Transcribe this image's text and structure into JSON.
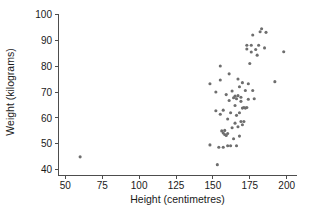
{
  "chart_data": {
    "type": "scatter",
    "title": "",
    "xlabel": "Height (centimetres)",
    "ylabel": "Weight (kilograms)",
    "xlim": [
      45,
      207
    ],
    "ylim": [
      38,
      102
    ],
    "xticks": [
      50,
      75,
      100,
      125,
      150,
      175,
      200
    ],
    "yticks": [
      40,
      50,
      60,
      70,
      80,
      90,
      100
    ],
    "xtick_labels": [
      "50",
      "75",
      "100",
      "125",
      "150",
      "175",
      "200"
    ],
    "ytick_labels": [
      "40",
      "50",
      "60",
      "70",
      "80",
      "90",
      "100"
    ],
    "grid": false,
    "legend": null,
    "marker_color": "#6e6e6e",
    "marker_size": 3.1,
    "points": [
      [
        60,
        45.0
      ],
      [
        148,
        73.2
      ],
      [
        148,
        49.6
      ],
      [
        152,
        62.8
      ],
      [
        152,
        70.0
      ],
      [
        153,
        42.0
      ],
      [
        154,
        48.7
      ],
      [
        155,
        61.4
      ],
      [
        155,
        74.6
      ],
      [
        155,
        80.0
      ],
      [
        156,
        55.0
      ],
      [
        157,
        54.2
      ],
      [
        157,
        48.7
      ],
      [
        157,
        63.0
      ],
      [
        158,
        53.6
      ],
      [
        158,
        55.2
      ],
      [
        159,
        53.2
      ],
      [
        159,
        69.0
      ],
      [
        160,
        59.6
      ],
      [
        160,
        49.3
      ],
      [
        160,
        54.0
      ],
      [
        161,
        66.7
      ],
      [
        161,
        77.0
      ],
      [
        162,
        49.3
      ],
      [
        162,
        62.0
      ],
      [
        163,
        56.2
      ],
      [
        163,
        70.4
      ],
      [
        164,
        52.0
      ],
      [
        164,
        67.8
      ],
      [
        165,
        58.0
      ],
      [
        165,
        64.8
      ],
      [
        165,
        68.4
      ],
      [
        166,
        49.3
      ],
      [
        166,
        61.0
      ],
      [
        166,
        67.4
      ],
      [
        167,
        56.6
      ],
      [
        167,
        75.0
      ],
      [
        167,
        68.6
      ],
      [
        168,
        53.0
      ],
      [
        168,
        62.0
      ],
      [
        168,
        72.0
      ],
      [
        169,
        58.6
      ],
      [
        169,
        66.4
      ],
      [
        169,
        68.0
      ],
      [
        170,
        57.4
      ],
      [
        170,
        63.8
      ],
      [
        170,
        73.6
      ],
      [
        171,
        58.6
      ],
      [
        171,
        64.0
      ],
      [
        172,
        63.8
      ],
      [
        172,
        70.6
      ],
      [
        173,
        64.0
      ],
      [
        173,
        86.6
      ],
      [
        173,
        88.0
      ],
      [
        174,
        73.2
      ],
      [
        174,
        67.2
      ],
      [
        175,
        81.0
      ],
      [
        176,
        88.0
      ],
      [
        176,
        85.4
      ],
      [
        177,
        70.6
      ],
      [
        177,
        92.0
      ],
      [
        178,
        67.4
      ],
      [
        179,
        86.4
      ],
      [
        180,
        84.2
      ],
      [
        181,
        88.0
      ],
      [
        182,
        93.2
      ],
      [
        183,
        94.4
      ],
      [
        185,
        87.0
      ],
      [
        186,
        93.0
      ],
      [
        192,
        74.0
      ],
      [
        198,
        85.5
      ]
    ]
  }
}
